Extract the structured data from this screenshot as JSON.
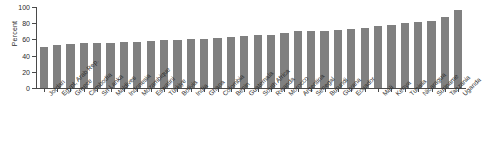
{
  "chart_data": {
    "type": "bar",
    "title": "",
    "subtitle": "",
    "xlabel": "",
    "ylabel": "Percent",
    "ylim": [
      0,
      100
    ],
    "yticks": [
      0,
      20,
      40,
      60,
      80,
      100
    ],
    "grid": false,
    "legend": null,
    "bar_color": "#808080",
    "axis_color": "#4a4a4a",
    "categories": [
      "Jordan",
      "Egypt, Arab Rep.",
      "Greece",
      "Cambodia",
      "Sri Lanka",
      "Maldives",
      "Indonesia",
      "Mozambique",
      "Eswatini",
      "Türkiye",
      "Bolivia",
      "India",
      "Ghana",
      "Colombia",
      "Benin",
      "Guatemala",
      "South Africa",
      "Rwanda",
      "Morocco",
      "Argentina",
      "Senegal",
      "Burundi",
      "Guyana",
      "Ecuador",
      "",
      "Mali",
      "Kenya",
      "Tunisia",
      "Nicaragua",
      "Suriname",
      "Tanzania",
      "Uganda"
    ],
    "values": [
      51,
      53,
      54,
      55,
      55,
      55,
      57,
      57,
      58,
      59,
      59,
      60,
      61,
      62,
      63,
      64,
      65,
      66,
      68,
      70,
      71,
      71,
      72,
      73,
      74,
      77,
      78,
      80,
      81,
      83,
      88,
      96
    ]
  },
  "axis": {
    "ylabel": "Percent",
    "ytick_labels": [
      "100",
      "80",
      "60",
      "40",
      "20",
      "0"
    ]
  }
}
